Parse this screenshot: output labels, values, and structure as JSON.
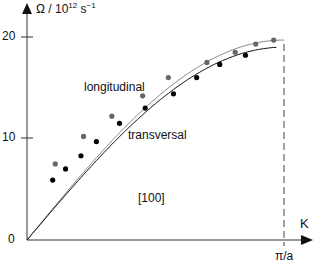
{
  "chart_data": {
    "type": "line",
    "title": "",
    "ylabel_html": "Ω / 10¹² s⁻¹",
    "ylabel": {
      "base": "Ω / 10",
      "exp1": "12",
      "unit": " s",
      "exp2": "−1"
    },
    "xlabel": "K",
    "x_end_label": "π/a",
    "direction_label": "[100]",
    "yticks": [
      0,
      10,
      20
    ],
    "ylim": [
      0,
      20
    ],
    "xlim": [
      0,
      1
    ],
    "x_unit": "fraction of π/a",
    "grid": false,
    "legend": "inline",
    "series": [
      {
        "name": "longitudinal",
        "color": "#777777",
        "marker_color": "#666666",
        "points": [
          [
            0.11,
            7.5
          ],
          [
            0.22,
            10.2
          ],
          [
            0.33,
            12.2
          ],
          [
            0.45,
            14.2
          ],
          [
            0.55,
            16.0
          ],
          [
            0.7,
            17.5
          ],
          [
            0.81,
            18.5
          ],
          [
            0.89,
            19.3
          ],
          [
            0.96,
            19.7
          ]
        ]
      },
      {
        "name": "transversal",
        "color": "#111111",
        "marker_color": "#000000",
        "points": [
          [
            0.1,
            5.9
          ],
          [
            0.15,
            7.0
          ],
          [
            0.21,
            8.3
          ],
          [
            0.27,
            9.7
          ],
          [
            0.36,
            11.5
          ],
          [
            0.46,
            13.0
          ],
          [
            0.57,
            14.4
          ],
          [
            0.66,
            16.0
          ],
          [
            0.75,
            17.3
          ],
          [
            0.85,
            18.2
          ]
        ]
      }
    ]
  },
  "labels": {
    "y20": "20",
    "y10": "10",
    "y0": "0",
    "k": "K",
    "pia": "π/a",
    "longitudinal": "longitudinal",
    "transversal": "transversal",
    "direction": "[100]"
  }
}
